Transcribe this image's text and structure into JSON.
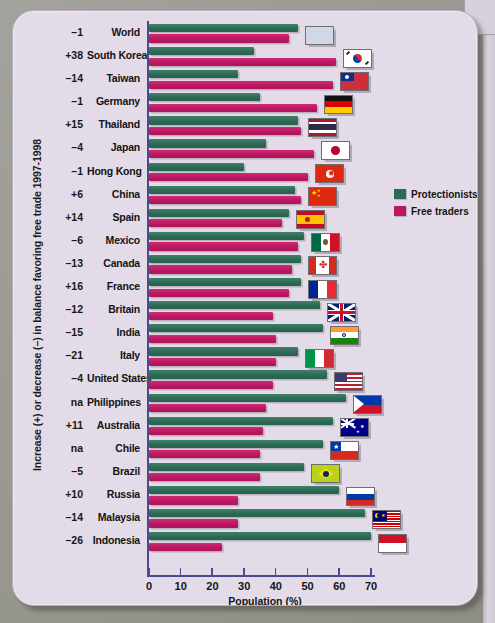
{
  "chart_data": {
    "type": "bar",
    "orientation": "horizontal",
    "title": "",
    "xlabel": "Population (%)",
    "ylabel": "Increase (+) or decrease (–) in balance favoring free trade 1997-1998",
    "xlim": [
      0,
      72
    ],
    "xticks": [
      0,
      10,
      20,
      30,
      40,
      50,
      60,
      70
    ],
    "grid": false,
    "legend_position": "right",
    "series": [
      {
        "name": "Protectionists",
        "color": "#2d6a54"
      },
      {
        "name": "Free traders",
        "color": "#bc1862"
      }
    ],
    "categories": [
      "World",
      "South Korea",
      "Taiwan",
      "Germany",
      "Thailand",
      "Japan",
      "Hong Kong",
      "China",
      "Spain",
      "Mexico",
      "Canada",
      "France",
      "Britain",
      "India",
      "Italy",
      "United States",
      "Philippines",
      "Australia",
      "Chile",
      "Brazil",
      "Russia",
      "Malaysia",
      "Indonesia"
    ],
    "change_label_header": "Increase (+) or decrease (–)",
    "rows": [
      {
        "country": "World",
        "change": "–1",
        "protectionists": 47,
        "free_traders": 44,
        "flag": "flag-world"
      },
      {
        "country": "South Korea",
        "change": "+38",
        "protectionists": 33,
        "free_traders": 59,
        "flag": "flag-south-korea"
      },
      {
        "country": "Taiwan",
        "change": "–14",
        "protectionists": 28,
        "free_traders": 58,
        "flag": "flag-taiwan"
      },
      {
        "country": "Germany",
        "change": "–1",
        "protectionists": 35,
        "free_traders": 53,
        "flag": "flag-germany"
      },
      {
        "country": "Thailand",
        "change": "+15",
        "protectionists": 47,
        "free_traders": 48,
        "flag": "flag-thailand"
      },
      {
        "country": "Japan",
        "change": "–4",
        "protectionists": 37,
        "free_traders": 52,
        "flag": "flag-japan"
      },
      {
        "country": "Hong Kong",
        "change": "–1",
        "protectionists": 30,
        "free_traders": 50,
        "flag": "flag-hong-kong"
      },
      {
        "country": "China",
        "change": "+6",
        "protectionists": 46,
        "free_traders": 48,
        "flag": "flag-china"
      },
      {
        "country": "Spain",
        "change": "+14",
        "protectionists": 44,
        "free_traders": 42,
        "flag": "flag-spain"
      },
      {
        "country": "Mexico",
        "change": "–6",
        "protectionists": 49,
        "free_traders": 47,
        "flag": "flag-mexico"
      },
      {
        "country": "Canada",
        "change": "–13",
        "protectionists": 48,
        "free_traders": 45,
        "flag": "flag-canada"
      },
      {
        "country": "France",
        "change": "+16",
        "protectionists": 48,
        "free_traders": 44,
        "flag": "flag-france"
      },
      {
        "country": "Britain",
        "change": "–12",
        "protectionists": 54,
        "free_traders": 39,
        "flag": "flag-britain"
      },
      {
        "country": "India",
        "change": "–15",
        "protectionists": 55,
        "free_traders": 40,
        "flag": "flag-india"
      },
      {
        "country": "Italy",
        "change": "–21",
        "protectionists": 47,
        "free_traders": 40,
        "flag": "flag-italy"
      },
      {
        "country": "United States",
        "change": "–4",
        "protectionists": 56,
        "free_traders": 39,
        "flag": "flag-united-states"
      },
      {
        "country": "Philippines",
        "change": "na",
        "protectionists": 62,
        "free_traders": 37,
        "flag": "flag-philippines"
      },
      {
        "country": "Australia",
        "change": "+11",
        "protectionists": 58,
        "free_traders": 36,
        "flag": "flag-australia"
      },
      {
        "country": "Chile",
        "change": "na",
        "protectionists": 55,
        "free_traders": 35,
        "flag": "flag-chile"
      },
      {
        "country": "Brazil",
        "change": "–5",
        "protectionists": 49,
        "free_traders": 35,
        "flag": "flag-brazil"
      },
      {
        "country": "Russia",
        "change": "+10",
        "protectionists": 60,
        "free_traders": 28,
        "flag": "flag-russia"
      },
      {
        "country": "Malaysia",
        "change": "–14",
        "protectionists": 68,
        "free_traders": 28,
        "flag": "flag-malaysia"
      },
      {
        "country": "Indonesia",
        "change": "–26",
        "protectionists": 70,
        "free_traders": 23,
        "flag": "flag-indonesia"
      }
    ]
  },
  "legend": {
    "items": [
      {
        "label": "Protectionists",
        "color": "#2d6a54"
      },
      {
        "label": "Free traders",
        "color": "#bc1862"
      }
    ]
  },
  "axis": {
    "x_title": "Population (%)",
    "y_title": "Increase (+) or decrease (–) in balance favoring free trade 1997-1998",
    "ticks": [
      "0",
      "10",
      "20",
      "30",
      "40",
      "50",
      "60",
      "70"
    ]
  },
  "colors": {
    "protectionists": "#2d6a54",
    "free_traders": "#bc1862",
    "card_background": "#e3dbe7",
    "axis": "#4a4a8c"
  }
}
